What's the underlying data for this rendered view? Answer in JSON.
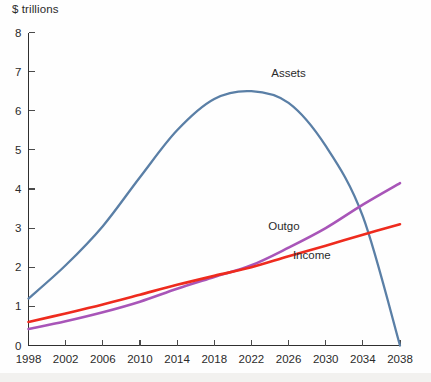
{
  "chart_data": {
    "type": "line",
    "title": "",
    "ylabel": "$ trillions",
    "xlabel": "",
    "xlim": [
      1998,
      2038
    ],
    "ylim": [
      0,
      8
    ],
    "grid": false,
    "legend_position": "inline-annotations",
    "x_ticks": [
      1998,
      2002,
      2006,
      2010,
      2014,
      2018,
      2022,
      2026,
      2030,
      2034,
      2038
    ],
    "x_tick_labels": [
      "1998",
      "2002",
      "2006",
      "2010",
      "2014",
      "2018",
      "2022",
      "2026",
      "2030",
      "2034",
      "2038"
    ],
    "y_ticks": [
      0,
      1,
      2,
      3,
      4,
      5,
      6,
      7,
      8
    ],
    "y_tick_labels": [
      "0",
      "1",
      "2",
      "3",
      "4",
      "5",
      "6",
      "7",
      "8"
    ],
    "x": [
      1998,
      2002,
      2006,
      2010,
      2014,
      2018,
      2022,
      2026,
      2030,
      2034,
      2038
    ],
    "series": [
      {
        "name": "Assets",
        "color": "#5a7fa6",
        "values": [
          1.2,
          2.05,
          3.05,
          4.3,
          5.5,
          6.3,
          6.5,
          6.2,
          5.1,
          3.3,
          0.0
        ]
      },
      {
        "name": "Outgo",
        "color": "#a855b8",
        "values": [
          0.42,
          0.62,
          0.85,
          1.12,
          1.45,
          1.75,
          2.05,
          2.5,
          3.0,
          3.6,
          4.15
        ]
      },
      {
        "name": "Income",
        "color": "#ee2b1e",
        "values": [
          0.6,
          0.82,
          1.05,
          1.3,
          1.55,
          1.78,
          2.0,
          2.28,
          2.55,
          2.83,
          3.1
        ]
      }
    ],
    "annotations": [
      {
        "text": "Assets",
        "x": 2026,
        "y": 6.85
      },
      {
        "text": "Outgo",
        "x": 2025.5,
        "y": 2.95
      },
      {
        "text": "Income",
        "x": 2028.5,
        "y": 2.22
      }
    ]
  },
  "axes": {
    "y_unit_caption": "$ trillions"
  },
  "colors": {
    "assets": "#5a7fa6",
    "outgo": "#a855b8",
    "income": "#ee2b1e",
    "axis": "#2f2f2f",
    "text": "#2b2b2b",
    "background": "#fefefe"
  }
}
